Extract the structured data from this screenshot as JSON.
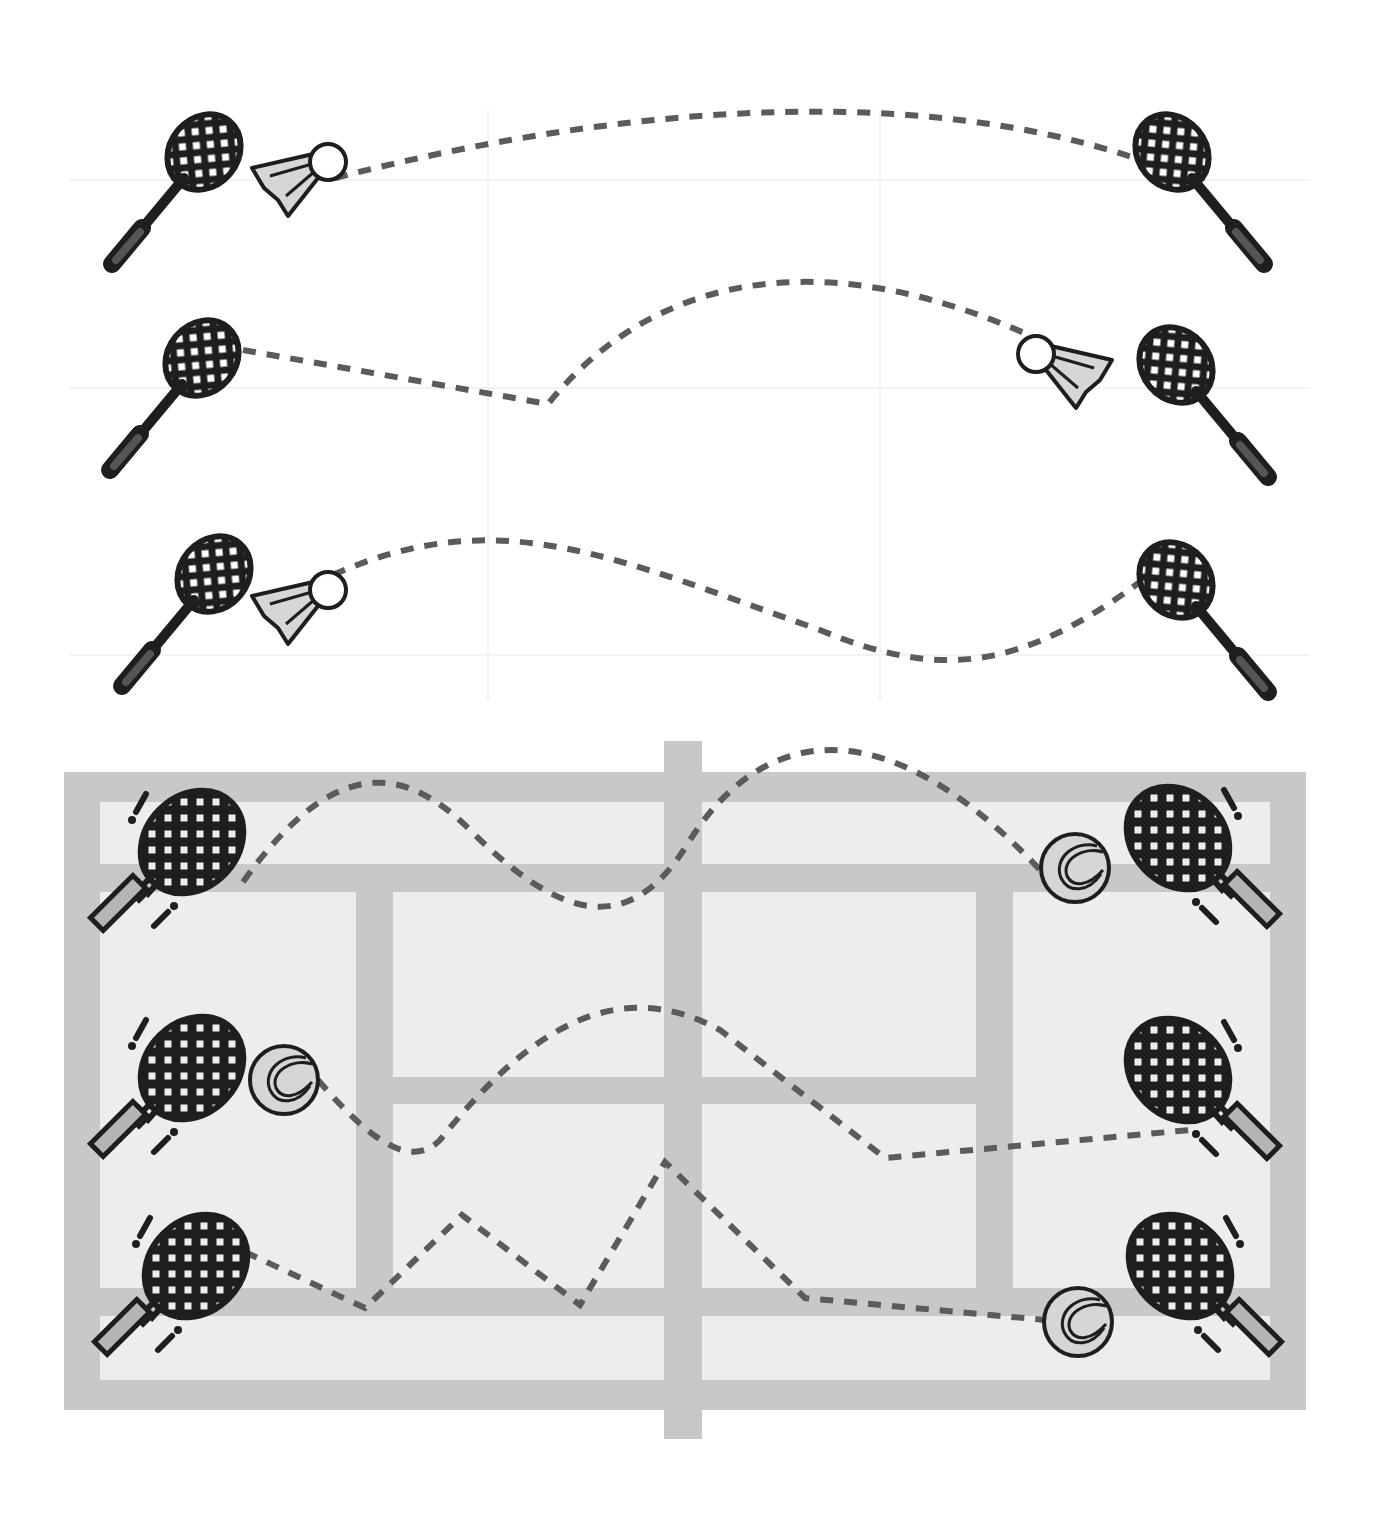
{
  "colors": {
    "background": "#ffffff",
    "background_grid": "#f3f3f3",
    "court_line": "#c8c8c8",
    "court_fill": "#ededed",
    "trajectory": "#5b5b5b",
    "icon_outline": "#1e1e1e",
    "icon_fill_light": "#d6d6d6",
    "icon_fill_mid": "#8c8c8c"
  },
  "sections": [
    {
      "name": "badminton",
      "rows": [
        {
          "id": "badminton-rally-1",
          "left_racket": "badminton-racket",
          "right_racket": "badminton-racket",
          "shuttlecock_position": "left",
          "path": "M 335 178 C 600 110, 900 80, 1135 158"
        },
        {
          "id": "badminton-rally-2",
          "left_racket": "badminton-racket",
          "right_racket": "badminton-racket",
          "shuttlecock_position": "right",
          "path": "M 243 350 L 548 404 C 640 290, 800 230, 1040 340"
        },
        {
          "id": "badminton-rally-3",
          "left_racket": "badminton-racket",
          "right_racket": "badminton-racket",
          "shuttlecock_position": "left",
          "path": "M 333 575 C 500 500, 620 560, 820 630 C 940 680, 1020 670, 1140 582"
        }
      ]
    },
    {
      "name": "tennis",
      "court": {
        "outer": [
          64,
          772,
          1306,
          1410
        ],
        "net_x": [
          664,
          702
        ],
        "net_y": [
          741,
          1439
        ]
      },
      "rows": [
        {
          "id": "tennis-rally-1",
          "left_racket": "tennis-racket",
          "right_racket": "tennis-racket",
          "ball_position": "right",
          "path": "M 243 882 C 330 760, 400 760, 470 830 C 560 920, 630 940, 690 840 C 760 730, 880 700, 1040 870"
        },
        {
          "id": "tennis-rally-2",
          "left_racket": "tennis-racket",
          "right_racket": "tennis-racket",
          "ball_position": "left",
          "path": "M 318 1080 C 370 1140, 410 1170, 440 1140 C 520 1040, 610 970, 720 1030 L 885 1158 L 1190 1130"
        },
        {
          "id": "tennis-rally-3",
          "left_racket": "tennis-racket",
          "right_racket": "tennis-racket",
          "ball_position": "right",
          "path": "M 245 1252 L 365 1308 L 462 1215 L 580 1305 L 665 1162 L 805 1298 L 1045 1320"
        }
      ]
    }
  ]
}
